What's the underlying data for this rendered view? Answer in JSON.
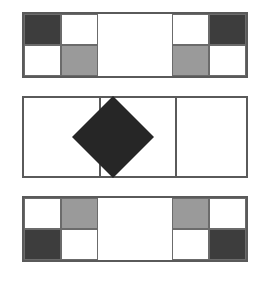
{
  "figure": {
    "background_color": "#ffffff",
    "width": 267,
    "height": 285,
    "palette": {
      "dark_square": "#3d3d3d",
      "gray_square": "#9a9a9a",
      "white_square": "#ffffff",
      "diamond": "#262626",
      "border": "#5a5a5a",
      "cell_outline": "#6b6b6b"
    },
    "panels": [
      {
        "id": "top-panel",
        "label": "Top panel",
        "x": 22,
        "y": 12,
        "width": 226,
        "height": 66,
        "columns": 6,
        "rows": 2,
        "description": "Checkered 2x2 blocks at the left and right ends, blank white span in the middle.",
        "cells": [
          {
            "col": 0,
            "row": 0,
            "fill": "dark",
            "name": "cell-r0c0"
          },
          {
            "col": 1,
            "row": 0,
            "fill": "white",
            "name": "cell-r0c1"
          },
          {
            "col": 4,
            "row": 0,
            "fill": "white",
            "name": "cell-r0c4"
          },
          {
            "col": 5,
            "row": 0,
            "fill": "dark",
            "name": "cell-r0c5"
          },
          {
            "col": 0,
            "row": 1,
            "fill": "white",
            "name": "cell-r1c0"
          },
          {
            "col": 1,
            "row": 1,
            "fill": "gray",
            "name": "cell-r1c1"
          },
          {
            "col": 4,
            "row": 1,
            "fill": "gray",
            "name": "cell-r1c4"
          },
          {
            "col": 5,
            "row": 1,
            "fill": "white",
            "name": "cell-r1c5"
          }
        ]
      },
      {
        "id": "middle-panel",
        "label": "Middle panel",
        "x": 22,
        "y": 96,
        "width": 226,
        "height": 82,
        "columns": 3,
        "rows": 1,
        "description": "Three equal columns with a dark inscribed diamond in the center column.",
        "separators": [
          75.33,
          150.67
        ],
        "diamond": {
          "name": "center-diamond",
          "fill": "#262626",
          "center_x": 113,
          "center_y": 137,
          "size": 58
        },
        "cells": []
      },
      {
        "id": "bottom-panel",
        "label": "Bottom panel",
        "x": 22,
        "y": 196,
        "width": 226,
        "height": 66,
        "columns": 6,
        "rows": 2,
        "description": "Checkered 2x2 blocks at the left and right ends, vertically mirrored from the top panel.",
        "cells": [
          {
            "col": 0,
            "row": 0,
            "fill": "white",
            "name": "cell-r0c0"
          },
          {
            "col": 1,
            "row": 0,
            "fill": "gray",
            "name": "cell-r0c1"
          },
          {
            "col": 4,
            "row": 0,
            "fill": "gray",
            "name": "cell-r0c4"
          },
          {
            "col": 5,
            "row": 0,
            "fill": "white",
            "name": "cell-r0c5"
          },
          {
            "col": 0,
            "row": 1,
            "fill": "dark",
            "name": "cell-r1c0"
          },
          {
            "col": 1,
            "row": 1,
            "fill": "white",
            "name": "cell-r1c1"
          },
          {
            "col": 4,
            "row": 1,
            "fill": "white",
            "name": "cell-r1c4"
          },
          {
            "col": 5,
            "row": 1,
            "fill": "dark",
            "name": "cell-r1c5"
          }
        ]
      }
    ]
  }
}
